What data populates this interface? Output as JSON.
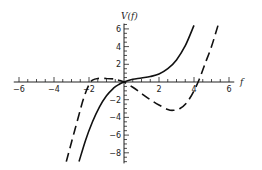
{
  "chart_data": {
    "type": "line",
    "title": "",
    "xlabel": "f",
    "ylabel": "V(f)",
    "xlim": [
      -6,
      6
    ],
    "ylim": [
      -9,
      6.5
    ],
    "grid": false,
    "legend": null,
    "x_ticks": [
      -6,
      -4,
      -2,
      2,
      4,
      6
    ],
    "y_ticks": [
      6,
      4,
      2,
      -2,
      -4,
      -6,
      -8
    ],
    "x_minor_step": 0.5,
    "y_minor_step": 0.5,
    "series": [
      {
        "name": "solid",
        "style": "solid",
        "color": "#111111",
        "points": [
          [
            -2.57,
            -9.0
          ],
          [
            -2.2,
            -6.6
          ],
          [
            -1.8,
            -4.5
          ],
          [
            -1.4,
            -2.8
          ],
          [
            -1.0,
            -1.55
          ],
          [
            -0.6,
            -0.7
          ],
          [
            -0.3,
            -0.28
          ],
          [
            0,
            0
          ],
          [
            0.5,
            0.3
          ],
          [
            1.0,
            0.45
          ],
          [
            1.5,
            0.62
          ],
          [
            2.0,
            0.9
          ],
          [
            2.5,
            1.5
          ],
          [
            3.0,
            2.5
          ],
          [
            3.5,
            4.1
          ],
          [
            4.0,
            6.4
          ]
        ]
      },
      {
        "name": "dashed",
        "style": "dashed",
        "color": "#111111",
        "points": [
          [
            -3.3,
            -9.0
          ],
          [
            -3.0,
            -6.8
          ],
          [
            -2.6,
            -3.9
          ],
          [
            -2.3,
            -1.8
          ],
          [
            -2.0,
            -0.3
          ],
          [
            -1.8,
            0.2
          ],
          [
            -1.5,
            0.4
          ],
          [
            -1.0,
            0.4
          ],
          [
            -0.6,
            0.35
          ],
          [
            -0.3,
            0.2
          ],
          [
            0,
            0
          ],
          [
            0.5,
            -0.6
          ],
          [
            1.0,
            -1.3
          ],
          [
            1.5,
            -2.0
          ],
          [
            2.0,
            -2.6
          ],
          [
            2.5,
            -3.1
          ],
          [
            2.8,
            -3.2
          ],
          [
            3.2,
            -3.0
          ],
          [
            3.6,
            -2.3
          ],
          [
            4.0,
            -1.0
          ],
          [
            4.3,
            0.3
          ],
          [
            4.6,
            1.9
          ],
          [
            5.0,
            4.0
          ],
          [
            5.37,
            6.4
          ]
        ]
      }
    ]
  },
  "axes": {
    "x_title": "f",
    "y_title": "V(f)"
  }
}
